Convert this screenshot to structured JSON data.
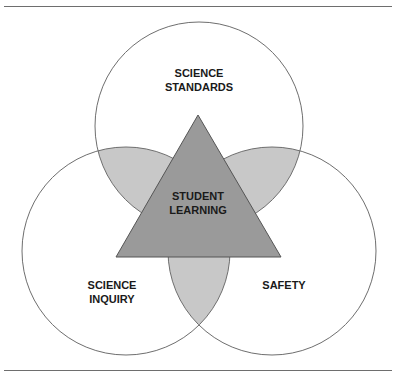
{
  "figure": {
    "caption_fragment": "",
    "labels": {
      "top": [
        "SCIENCE",
        "STANDARDS"
      ],
      "left": [
        "SCIENCE",
        "INQUIRY"
      ],
      "right": [
        "SAFETY"
      ],
      "center": [
        "STUDENT",
        "LEARNING"
      ]
    },
    "colors": {
      "circle_stroke": "#6e6e6e",
      "lens_fill": "#c8c8c8",
      "triangle_fill": "#9a9a9a",
      "triangle_stroke": "#555555"
    },
    "circles": [
      {
        "name": "science-standards",
        "cx": 199,
        "cy": 126,
        "r": 104
      },
      {
        "name": "science-inquiry",
        "cx": 126,
        "cy": 251,
        "r": 104
      },
      {
        "name": "safety",
        "cx": 272,
        "cy": 251,
        "r": 104
      }
    ],
    "triangle": {
      "apex": [
        198,
        115
      ],
      "base_left": [
        116,
        257
      ],
      "base_right": [
        281,
        257
      ]
    }
  }
}
